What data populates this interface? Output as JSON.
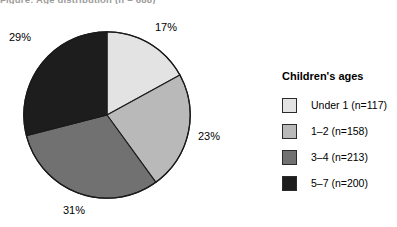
{
  "figure": {
    "title_partial": "Figure: Age distribution (n = 688)"
  },
  "legend": {
    "title": "Children's ages"
  },
  "chart_data": {
    "type": "pie",
    "title": "",
    "xlabel": "",
    "ylabel": "",
    "legend_title": "Children's ages",
    "legend_position": "right",
    "start_angle_deg": 0,
    "direction": "clockwise",
    "total_n": 688,
    "categories": [
      "Under 1 (n=117)",
      "1–2 (n=158)",
      "3–4 (n=213)",
      "5–7 (n=200)"
    ],
    "labels": [
      "17%",
      "23%",
      "31%",
      "29%"
    ],
    "values": [
      17,
      23,
      31,
      29
    ],
    "counts": [
      117,
      158,
      213,
      200
    ],
    "colors": [
      "#e3e3e3",
      "#b9b9b9",
      "#717171",
      "#1d1d1d"
    ],
    "slice_edge_color": "#1a1a1a"
  }
}
